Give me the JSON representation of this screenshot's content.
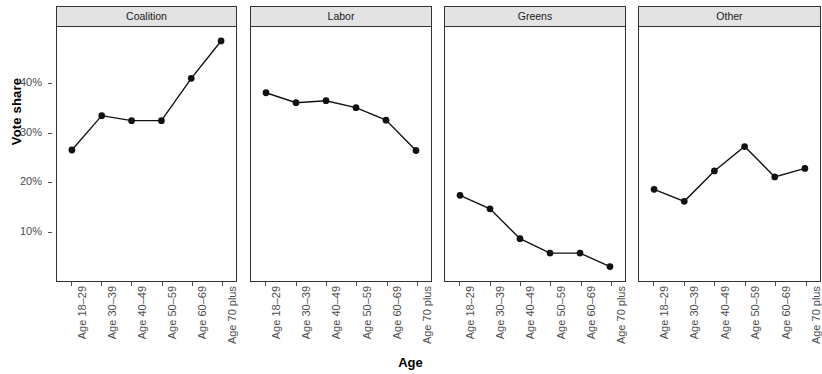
{
  "chart": {
    "type": "line",
    "xlabel": "Age",
    "ylabel": "Vote share"
  },
  "axis": {
    "y_ticks": [
      "10%",
      "20%",
      "30%",
      "40%"
    ],
    "y_tick_values": [
      10,
      20,
      30,
      40
    ],
    "ylim": [
      0,
      51
    ],
    "x_categories": [
      "Age 18–29",
      "Age 30–39",
      "Age 40–49",
      "Age 50–59",
      "Age 60–69",
      "Age 70 plus"
    ]
  },
  "panels": [
    {
      "label": "Coalition"
    },
    {
      "label": "Labor"
    },
    {
      "label": "Greens"
    },
    {
      "label": "Other"
    }
  ],
  "chart_data": {
    "type": "line",
    "title": "",
    "subtitle": "",
    "xlabel": "Age",
    "ylabel": "Vote share",
    "facet_by": "Party",
    "facets": [
      "Coalition",
      "Labor",
      "Greens",
      "Other"
    ],
    "categories": [
      "Age 18–29",
      "Age 30–39",
      "Age 40–49",
      "Age 50–59",
      "Age 60–69",
      "Age 70 plus"
    ],
    "series": [
      {
        "name": "Coalition",
        "values": [
          26.3,
          33.2,
          32.2,
          32.2,
          40.7,
          48.2
        ]
      },
      {
        "name": "Labor",
        "values": [
          37.8,
          35.8,
          36.2,
          34.8,
          32.3,
          26.2
        ]
      },
      {
        "name": "Greens",
        "values": [
          17.2,
          14.5,
          8.5,
          5.6,
          5.6,
          2.9
        ]
      },
      {
        "name": "Other",
        "values": [
          18.4,
          16.0,
          22.1,
          27.0,
          20.9,
          22.6
        ]
      }
    ],
    "ylim": [
      0,
      51
    ],
    "ytick_labels": [
      "10%",
      "20%",
      "30%",
      "40%"
    ],
    "ytick_values": [
      10,
      20,
      30,
      40
    ],
    "grid": false,
    "legend": "none",
    "units": "percent",
    "marker": "filled-circle",
    "line_color": "#111111",
    "strip_background": "#e3e3e3"
  }
}
